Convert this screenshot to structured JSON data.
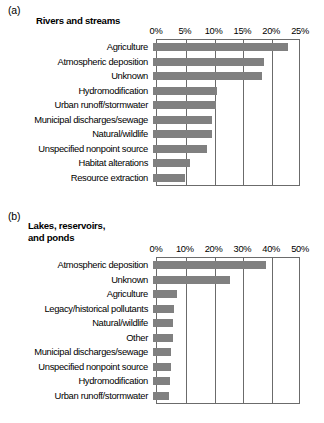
{
  "figure": {
    "panels": [
      {
        "letter": "(a)",
        "title": "Rivers and streams",
        "tick_labels": [
          "0%",
          "5%",
          "10%",
          "15%",
          "20%",
          "25%"
        ]
      },
      {
        "letter": "(b)",
        "title": "Lakes, reservoirs, and ponds",
        "tick_labels": [
          "0%",
          "10%",
          "20%",
          "30%",
          "40%",
          "50%"
        ]
      }
    ]
  },
  "chart_data": [
    {
      "type": "bar",
      "orientation": "horizontal",
      "panel": "(a)",
      "title": "Rivers and streams",
      "xlabel": "",
      "ylabel": "",
      "xlim": [
        0,
        25
      ],
      "xticks": [
        0,
        5,
        10,
        15,
        20,
        25
      ],
      "xtick_labels": [
        "0%",
        "5%",
        "10%",
        "15%",
        "20%",
        "25%"
      ],
      "grid": "vertical",
      "legend": "none",
      "bar_color": "#808080",
      "units": "percent",
      "categories": [
        "Agriculture",
        "Atmospheric deposition",
        "Unknown",
        "Hydromodification",
        "Urban runoff/stormwater",
        "Municipal discharges/sewage",
        "Natural/wildlife",
        "Unspecified nonpoint source",
        "Habitat alterations",
        "Resource extraction"
      ],
      "values": [
        23.5,
        19.3,
        19.0,
        11.1,
        10.9,
        10.3,
        10.2,
        9.3,
        6.4,
        5.5
      ]
    },
    {
      "type": "bar",
      "orientation": "horizontal",
      "panel": "(b)",
      "title": "Lakes, reservoirs, and ponds",
      "xlabel": "",
      "ylabel": "",
      "xlim": [
        0,
        50
      ],
      "xticks": [
        0,
        10,
        20,
        30,
        40,
        50
      ],
      "xtick_labels": [
        "0%",
        "10%",
        "20%",
        "30%",
        "40%",
        "50%"
      ],
      "grid": "vertical",
      "legend": "none",
      "bar_color": "#808080",
      "units": "percent",
      "categories": [
        "Atmospheric deposition",
        "Unknown",
        "Agriculture",
        "Legacy/historical pollutants",
        "Natural/wildlife",
        "Other",
        "Municipal discharges/sewage",
        "Unspecified nonpoint source",
        "Hydromodification",
        "Urban runoff/stormwater"
      ],
      "values": [
        39.2,
        26.7,
        8.4,
        7.4,
        7.1,
        6.9,
        6.3,
        6.1,
        6.0,
        5.7
      ]
    }
  ]
}
